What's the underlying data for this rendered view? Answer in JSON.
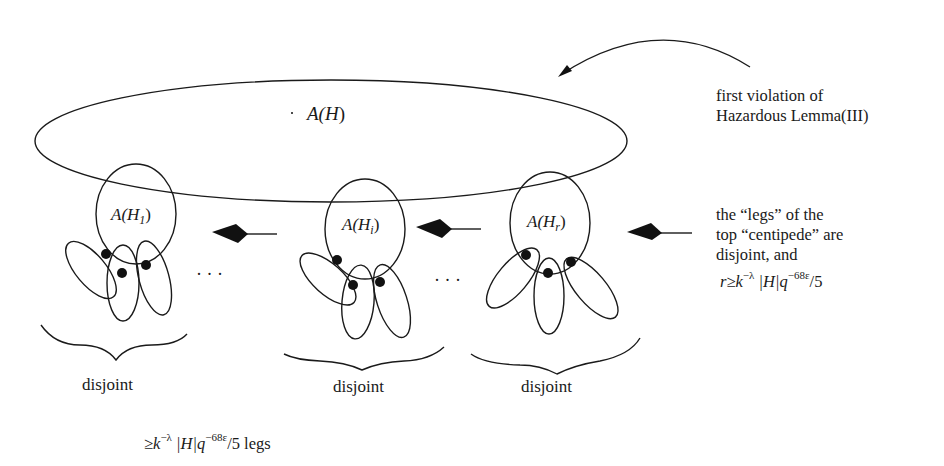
{
  "diagram": {
    "outer_set": {
      "label_main": "A(",
      "label_var": "H",
      "label_close": ")"
    },
    "subsets": [
      {
        "id": "H1",
        "label_prefix": "A(",
        "label_var": "H",
        "label_sub": "1",
        "label_close": ")"
      },
      {
        "id": "Hi",
        "label_prefix": "A(",
        "label_var": "H",
        "label_sub": "i",
        "label_close": ")"
      },
      {
        "id": "Hr",
        "label_prefix": "A(",
        "label_var": "H",
        "label_sub": "r",
        "label_close": ")"
      }
    ],
    "ellipsis": "· · ·",
    "brace_labels": [
      "disjoint",
      "disjoint",
      "disjoint"
    ],
    "annotation_top": {
      "lines": [
        "first violation of",
        "Hazardous Lemma(III)"
      ]
    },
    "annotation_right": {
      "lines": [
        "the “legs” of the",
        "top “centipede” are",
        "disjoint, and"
      ],
      "formula": {
        "lhs": "r",
        "rel": "≥",
        "k": "k",
        "k_exp": "−λ",
        "H": "|H|",
        "q": "q",
        "q_exp": "−68ε",
        "tail": "/5"
      }
    },
    "bottom_formula": {
      "rel": "≥",
      "k": "k",
      "k_exp": "−λ",
      "H": "|H|",
      "q": "q",
      "q_exp": "−68ε",
      "tail": "/5 legs"
    },
    "colors": {
      "stroke": "#1a1a1a",
      "fill_dot": "#111111",
      "background": "#ffffff"
    }
  }
}
